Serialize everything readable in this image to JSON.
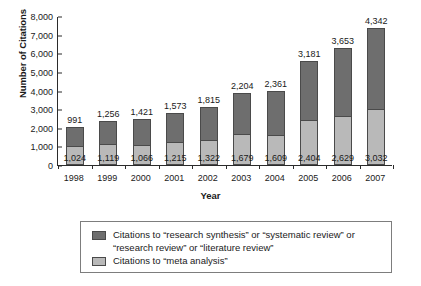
{
  "chart_data": {
    "type": "bar",
    "subtype": "stacked-vertical",
    "title": "",
    "xlabel": "Year",
    "ylabel": "Number of Citations",
    "categories": [
      "1998",
      "1999",
      "2000",
      "2001",
      "2002",
      "2003",
      "2004",
      "2005",
      "2006",
      "2007"
    ],
    "series": [
      {
        "name": "Citations to \"meta analysis\"",
        "color": "#b9b9b9",
        "values": [
          1024,
          1119,
          1066,
          1215,
          1322,
          1679,
          1609,
          2404,
          2629,
          3032
        ],
        "labels": [
          "1,024",
          "1,119",
          "1,066",
          "1,215",
          "1,322",
          "1,679",
          "1,609",
          "2,404",
          "2,629",
          "3,032"
        ]
      },
      {
        "name": "Citations to \"research synthesis\" or \"systematic review\" or \"research review\" or \"literature review\"",
        "color": "#6e6e6e",
        "values": [
          991,
          1256,
          1421,
          1573,
          1815,
          2204,
          2361,
          3181,
          3653,
          4342
        ],
        "labels": [
          "991",
          "1,256",
          "1,421",
          "1,573",
          "1,815",
          "2,204",
          "2,361",
          "3,181",
          "3,653",
          "4,342"
        ]
      }
    ],
    "ylim": [
      0,
      8000
    ],
    "yticks": [
      0,
      1000,
      2000,
      3000,
      4000,
      5000,
      6000,
      7000,
      8000
    ],
    "ytick_labels": [
      "0",
      "1,000",
      "2,000",
      "3,000",
      "4,000",
      "5,000",
      "6,000",
      "7,000",
      "8,000"
    ],
    "grid": false,
    "legend_position": "bottom"
  },
  "legend": {
    "entries": [
      {
        "swatch": "dark-gray-swatch",
        "label": "Citations to “research synthesis” or “systematic review” or\n“research review” or “literature review”"
      },
      {
        "swatch": "light-gray-swatch",
        "label": "Citations to “meta analysis”"
      }
    ]
  },
  "colors": {
    "series_dark": "#6e6e6e",
    "series_light": "#b9b9b9",
    "axis": "#2b2b2b",
    "legend_border": "#7d7d7d",
    "background": "#ffffff"
  }
}
